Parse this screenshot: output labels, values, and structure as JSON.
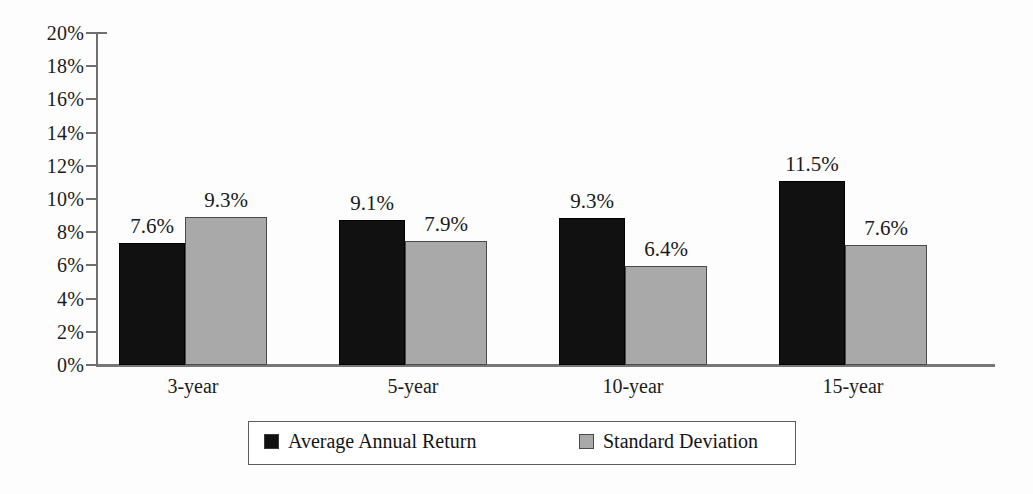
{
  "chart_data": {
    "type": "bar",
    "title": "",
    "xlabel": "",
    "ylabel": "",
    "ylim": [
      0,
      20
    ],
    "ytick_step": 2,
    "grid": false,
    "legend_position": "bottom",
    "categories": [
      "3-year",
      "5-year",
      "10-year",
      "15-year"
    ],
    "ytick_labels": [
      "20%",
      "18%",
      "16%",
      "14%",
      "12%",
      "10%",
      "8%",
      "6%",
      "4%",
      "2%",
      "0%"
    ],
    "ytick_values": [
      20,
      18,
      16,
      14,
      12,
      10,
      8,
      6,
      4,
      2,
      0
    ],
    "series": [
      {
        "name": "Average Annual Return",
        "color": "#111111",
        "values": [
          7.6,
          9.1,
          9.3,
          11.5
        ],
        "labels": [
          "7.6%",
          "9.1%",
          "9.3%",
          "11.5%"
        ],
        "drawn_values": [
          7.35,
          8.75,
          8.85,
          11.1
        ]
      },
      {
        "name": "Standard Deviation",
        "color": "#a9a9a9",
        "values": [
          9.3,
          7.9,
          6.4,
          7.6
        ],
        "labels": [
          "9.3%",
          "7.9%",
          "6.4%",
          "7.6%"
        ],
        "drawn_values": [
          8.9,
          7.45,
          5.95,
          7.2
        ]
      }
    ]
  },
  "legend": {
    "items": [
      {
        "label": "Average Annual Return",
        "swatch": "black"
      },
      {
        "label": "Standard Deviation",
        "swatch": "gray"
      }
    ]
  }
}
